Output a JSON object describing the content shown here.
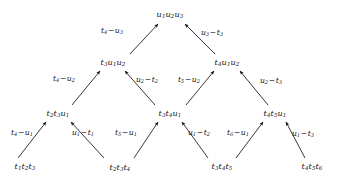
{
  "figure": {
    "type": "lattice-arrow-diagram",
    "width": 339,
    "height": 180,
    "background_color": "#ffffff",
    "ink_color": "#141414",
    "levels": 4
  },
  "nodes": [
    {
      "id": "n0",
      "label": "u1u2u3",
      "level": 0,
      "x": 170,
      "y": 14
    },
    {
      "id": "n1",
      "label": "t3u1u2",
      "level": 1,
      "x": 113,
      "y": 62
    },
    {
      "id": "n2",
      "label": "t4u1u2",
      "level": 1,
      "x": 227,
      "y": 62
    },
    {
      "id": "n3",
      "label": "t2t3u1",
      "level": 2,
      "x": 58,
      "y": 113
    },
    {
      "id": "n4",
      "label": "t3t4u1",
      "level": 2,
      "x": 170,
      "y": 113
    },
    {
      "id": "n5",
      "label": "t4t5u1",
      "level": 2,
      "x": 275,
      "y": 113
    },
    {
      "id": "n6",
      "label": "t1t2t3",
      "level": 3,
      "x": 25,
      "y": 166
    },
    {
      "id": "n7",
      "label": "t2t3t4",
      "level": 3,
      "x": 120,
      "y": 167
    },
    {
      "id": "n8",
      "label": "t3t4t5",
      "level": 3,
      "x": 222,
      "y": 166
    },
    {
      "id": "n9",
      "label": "t4t5t6",
      "level": 3,
      "x": 312,
      "y": 166
    }
  ],
  "edges": [
    {
      "id": "e0",
      "from": "n1",
      "to": "n0",
      "label": "t4-u3",
      "label_x": 112,
      "label_y": 31,
      "x1": 130,
      "y1": 54,
      "x2": 158,
      "y2": 24
    },
    {
      "id": "e1",
      "from": "n2",
      "to": "n0",
      "label": "u3-t3",
      "label_x": 212,
      "label_y": 33,
      "x1": 215,
      "y1": 54,
      "x2": 185,
      "y2": 24
    },
    {
      "id": "e2",
      "from": "n3",
      "to": "n1",
      "label": "t4-u2",
      "label_x": 64,
      "label_y": 79,
      "x1": 72,
      "y1": 105,
      "x2": 100,
      "y2": 71
    },
    {
      "id": "e3",
      "from": "n4",
      "to": "n1",
      "label": "u2-t2",
      "label_x": 147,
      "label_y": 80,
      "x1": 155,
      "y1": 105,
      "x2": 125,
      "y2": 71
    },
    {
      "id": "e4",
      "from": "n4",
      "to": "n2",
      "label": "t5-u2",
      "label_x": 189,
      "label_y": 80,
      "x1": 186,
      "y1": 105,
      "x2": 214,
      "y2": 71
    },
    {
      "id": "e5",
      "from": "n5",
      "to": "n2",
      "label": "u2-t3",
      "label_x": 271,
      "label_y": 81,
      "x1": 268,
      "y1": 105,
      "x2": 240,
      "y2": 71
    },
    {
      "id": "e6",
      "from": "n6",
      "to": "n3",
      "label": "t4-u1",
      "label_x": 22,
      "label_y": 133,
      "x1": 18,
      "y1": 158,
      "x2": 46,
      "y2": 122
    },
    {
      "id": "e7",
      "from": "n7",
      "to": "n3",
      "label": "u1-t1",
      "label_x": 83,
      "label_y": 133,
      "x1": 104,
      "y1": 158,
      "x2": 71,
      "y2": 122
    },
    {
      "id": "e8",
      "from": "n7",
      "to": "n4",
      "label": "t5-u1",
      "label_x": 126,
      "label_y": 133,
      "x1": 134,
      "y1": 158,
      "x2": 158,
      "y2": 122
    },
    {
      "id": "e9",
      "from": "n8",
      "to": "n4",
      "label": "u1-t2",
      "label_x": 199,
      "label_y": 133,
      "x1": 208,
      "y1": 158,
      "x2": 182,
      "y2": 122
    },
    {
      "id": "e10",
      "from": "n8",
      "to": "n5",
      "label": "t6-u1",
      "label_x": 238,
      "label_y": 133,
      "x1": 236,
      "y1": 158,
      "x2": 263,
      "y2": 122
    },
    {
      "id": "e11",
      "from": "n9",
      "to": "n5",
      "label": "u1-t3",
      "label_x": 303,
      "label_y": 134,
      "x1": 305,
      "y1": 158,
      "x2": 286,
      "y2": 122
    }
  ]
}
